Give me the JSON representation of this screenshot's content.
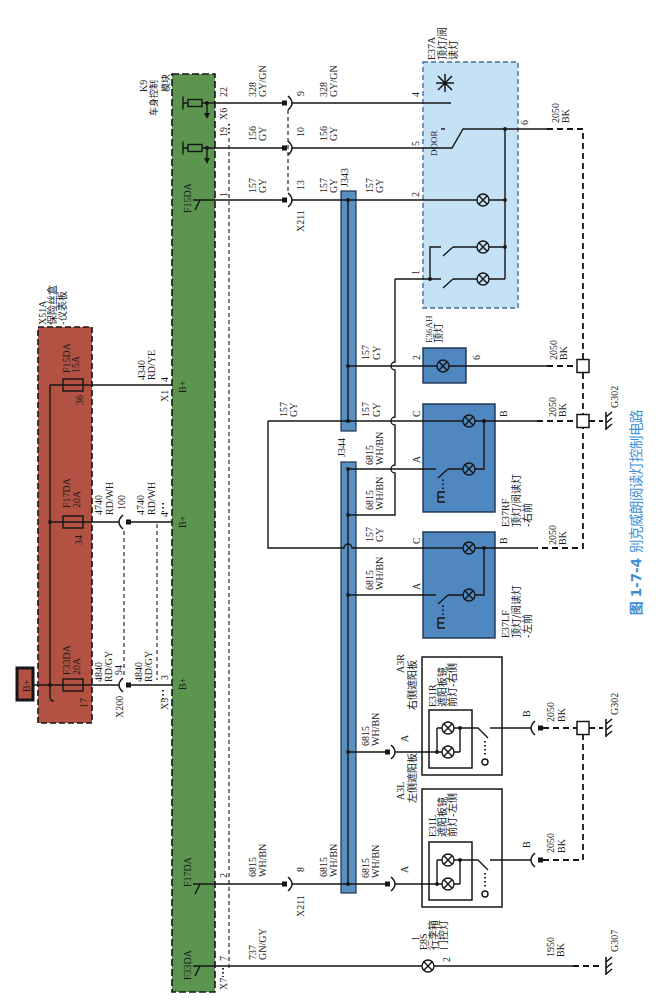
{
  "figure": {
    "number": "图 1-7-4",
    "title": "别克威朗阅读灯控制电路",
    "caption_color": "#3d8fd4"
  },
  "palette": {
    "bcm_module": "#5c9550",
    "fuse_box": "#b35242",
    "splice_bar": "#5a8fc1",
    "lamp_module": "#4f87c0",
    "roof_console": "#c5e1f6"
  },
  "battery": {
    "label": "B+"
  },
  "fuse_box": {
    "id": "X51A",
    "name": "保险丝盒",
    "location": "-仪表板",
    "fuses": [
      {
        "id": "F15DA",
        "rating": "15A",
        "pin": "36"
      },
      {
        "id": "F17DA",
        "rating": "20A",
        "pin": "34"
      },
      {
        "id": "F33DA",
        "rating": "20A",
        "pin": "17"
      }
    ]
  },
  "bcm": {
    "id": "K9",
    "name_line1": "车身控制",
    "name_line2": "模块",
    "supply_label": "B+",
    "output_fuses": [
      "F15DA",
      "F17DA",
      "F33DA"
    ]
  },
  "circuits": {
    "c4340": {
      "number": "4340",
      "color": "RD/YE"
    },
    "c4740": {
      "number": "4740",
      "color": "RD/WH"
    },
    "c4840": {
      "number": "4840",
      "color": "RD/GY"
    },
    "c328": {
      "number": "328",
      "color": "GY/GN"
    },
    "c156": {
      "number": "156",
      "color": "GY"
    },
    "c157": {
      "number": "157",
      "color": "GY"
    },
    "c6815": {
      "number": "6815",
      "color": "WH/BN"
    },
    "c737": {
      "number": "737",
      "color": "GN/GY"
    },
    "c2050": {
      "number": "2050",
      "color": "BK"
    },
    "c1950": {
      "number": "1950",
      "color": "BK"
    }
  },
  "connectors": {
    "x1": {
      "id": "X1",
      "pin": "4"
    },
    "x5": {
      "id": "X5",
      "pins": [
        "4",
        "3"
      ]
    },
    "x200": {
      "id": "X200",
      "pins": [
        "100",
        "94"
      ]
    },
    "x6": {
      "id": "X6",
      "pins": [
        "22",
        "19"
      ]
    },
    "x7": {
      "id": "X7",
      "pins": [
        "1",
        "2",
        "7"
      ]
    },
    "x211": {
      "id": "X211",
      "pins": [
        "9",
        "10",
        "13",
        "8"
      ]
    }
  },
  "splices": {
    "j343": "J343",
    "j344": "J344"
  },
  "components": {
    "e37a": {
      "id": "E37A",
      "name_line1": "顶灯/阅",
      "name_line2": "读灯",
      "switch_label": "DOOR",
      "pins": {
        "sensor": "4",
        "door": "5",
        "lamp": "2",
        "switched": "1",
        "ground": "6"
      }
    },
    "e36ah": {
      "id": "E36AH",
      "name": "顶灯",
      "pins": {
        "in": "2",
        "out": "6"
      }
    },
    "e37rf": {
      "id": "E37RF",
      "name_line1": "顶灯/阅读灯",
      "name_line2": "-右前",
      "pins": {
        "c": "C",
        "a": "A",
        "b": "B"
      }
    },
    "e37lf": {
      "id": "E37LF",
      "name_line1": "顶灯/阅读灯",
      "name_line2": "-左前",
      "pins": {
        "c": "C",
        "a": "A",
        "b": "B"
      }
    },
    "a3r": {
      "id": "A3R",
      "name": "右侧遮阳板",
      "pins": {
        "a": "A",
        "b": "B"
      },
      "lamp": {
        "id": "E31R",
        "name_line1": "遮阳板镜",
        "name_line2": "前灯-右侧"
      }
    },
    "a3l": {
      "id": "A3L",
      "name": "左侧遮阳板",
      "pins": {
        "a": "A",
        "b": "B"
      },
      "lamp": {
        "id": "E31L",
        "name_line1": "遮阳板镜",
        "name_line2": "前灯-左侧"
      }
    },
    "e8s": {
      "id": "E8S",
      "name_line1": "行李箱",
      "name_line2": "门控灯",
      "pins": {
        "in": "1",
        "out": "2"
      }
    }
  },
  "grounds": {
    "g302": "G302",
    "g307": "G307"
  }
}
